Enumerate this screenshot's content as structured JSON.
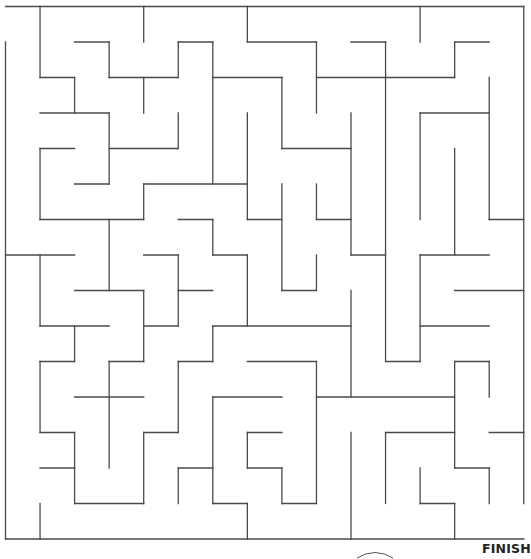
{
  "maze": {
    "cols": 15,
    "rows": 15,
    "origin_x": 5.5,
    "origin_y": 6.5,
    "cell_w": 34.55,
    "cell_h": 35.5,
    "wall_color": "#4a4a4a",
    "entrance": "left side, top row",
    "exit": "right side, bottom row",
    "horizontal_walls": [
      [
        0,
        0,
        15
      ],
      [
        1,
        2,
        3
      ],
      [
        1,
        5,
        6
      ],
      [
        1,
        7,
        9
      ],
      [
        1,
        10,
        11
      ],
      [
        1,
        13,
        14
      ],
      [
        2,
        1,
        2
      ],
      [
        2,
        3,
        5
      ],
      [
        2,
        6,
        8
      ],
      [
        2,
        9,
        13
      ],
      [
        3,
        1,
        3
      ],
      [
        3,
        12,
        14
      ],
      [
        4,
        1,
        2
      ],
      [
        4,
        3,
        5
      ],
      [
        4,
        8,
        10
      ],
      [
        5,
        2,
        3
      ],
      [
        5,
        4,
        7
      ],
      [
        6,
        1,
        4
      ],
      [
        6,
        5,
        6
      ],
      [
        6,
        7,
        8
      ],
      [
        6,
        9,
        10
      ],
      [
        6,
        14,
        15
      ],
      [
        7,
        0,
        2
      ],
      [
        7,
        4,
        5
      ],
      [
        7,
        6,
        7
      ],
      [
        7,
        10,
        11
      ],
      [
        7,
        12,
        14
      ],
      [
        8,
        2,
        4
      ],
      [
        8,
        5,
        6
      ],
      [
        8,
        8,
        9
      ],
      [
        8,
        13,
        15
      ],
      [
        9,
        1,
        3
      ],
      [
        9,
        4,
        5
      ],
      [
        9,
        6,
        10
      ],
      [
        9,
        12,
        14
      ],
      [
        10,
        1,
        2
      ],
      [
        10,
        3,
        4
      ],
      [
        10,
        5,
        6
      ],
      [
        10,
        7,
        9
      ],
      [
        10,
        11,
        12
      ],
      [
        10,
        13,
        14
      ],
      [
        11,
        2,
        4
      ],
      [
        11,
        6,
        8
      ],
      [
        11,
        9,
        13
      ],
      [
        12,
        1,
        2
      ],
      [
        12,
        4,
        5
      ],
      [
        12,
        7,
        8
      ],
      [
        12,
        11,
        13
      ],
      [
        12,
        14,
        15
      ],
      [
        13,
        1,
        2
      ],
      [
        13,
        5,
        6
      ],
      [
        13,
        7,
        8
      ],
      [
        13,
        13,
        14
      ],
      [
        14,
        2,
        4
      ],
      [
        14,
        6,
        7
      ],
      [
        14,
        8,
        9
      ],
      [
        14,
        12,
        13
      ],
      [
        15,
        0,
        15
      ]
    ],
    "vertical_walls": [
      [
        0,
        1,
        15
      ],
      [
        1,
        0,
        2
      ],
      [
        1,
        4,
        6
      ],
      [
        1,
        7,
        9
      ],
      [
        1,
        10,
        12
      ],
      [
        1,
        14,
        15
      ],
      [
        2,
        2,
        3
      ],
      [
        2,
        9,
        10
      ],
      [
        2,
        12,
        14
      ],
      [
        3,
        1,
        2
      ],
      [
        3,
        3,
        5
      ],
      [
        3,
        6,
        8
      ],
      [
        3,
        10,
        13
      ],
      [
        4,
        0,
        1
      ],
      [
        4,
        2,
        3
      ],
      [
        4,
        5,
        6
      ],
      [
        4,
        8,
        10
      ],
      [
        4,
        12,
        14
      ],
      [
        5,
        1,
        2
      ],
      [
        5,
        3,
        4
      ],
      [
        5,
        7,
        9
      ],
      [
        5,
        10,
        12
      ],
      [
        5,
        13,
        14
      ],
      [
        6,
        1,
        5
      ],
      [
        6,
        6,
        7
      ],
      [
        6,
        9,
        10
      ],
      [
        6,
        11,
        14
      ],
      [
        7,
        0,
        1
      ],
      [
        7,
        3,
        6
      ],
      [
        7,
        7,
        9
      ],
      [
        7,
        12,
        13
      ],
      [
        7,
        14,
        15
      ],
      [
        8,
        2,
        4
      ],
      [
        8,
        5,
        8
      ],
      [
        8,
        13,
        14
      ],
      [
        9,
        1,
        3
      ],
      [
        9,
        5,
        6
      ],
      [
        9,
        7,
        8
      ],
      [
        9,
        10,
        14
      ],
      [
        10,
        3,
        7
      ],
      [
        10,
        8,
        11
      ],
      [
        10,
        12,
        15
      ],
      [
        11,
        1,
        10
      ],
      [
        11,
        12,
        14
      ],
      [
        12,
        0,
        1
      ],
      [
        12,
        3,
        6
      ],
      [
        12,
        7,
        10
      ],
      [
        12,
        13,
        14
      ],
      [
        13,
        1,
        2
      ],
      [
        13,
        4,
        7
      ],
      [
        13,
        10,
        13
      ],
      [
        13,
        14,
        15
      ],
      [
        14,
        2,
        6
      ],
      [
        14,
        10,
        11
      ],
      [
        14,
        13,
        14
      ],
      [
        15,
        0,
        14
      ]
    ]
  },
  "labels": {
    "finish": "FINISH"
  },
  "icons": {
    "finish_marker": "arc-icon"
  }
}
